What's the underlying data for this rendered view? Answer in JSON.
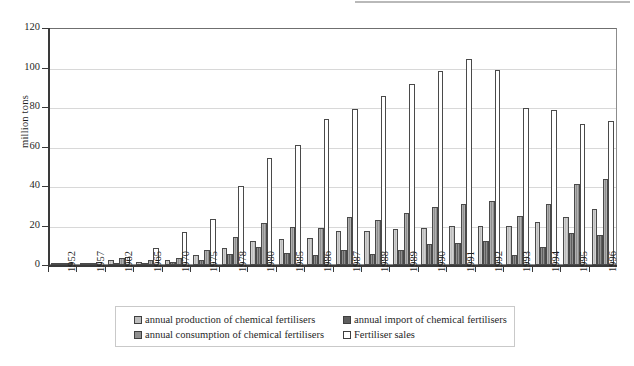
{
  "chart_data": {
    "type": "bar",
    "title": "",
    "xlabel": "",
    "ylabel": "million tons",
    "ylim": [
      0,
      120
    ],
    "ytick_step": 20,
    "yticks": [
      0,
      20,
      40,
      60,
      80,
      100,
      120
    ],
    "grid": true,
    "legend_position": "bottom",
    "categories": [
      "1952",
      "1957",
      "1962",
      "1965",
      "1970",
      "1975",
      "1978",
      "1980",
      "1985",
      "1986",
      "1987",
      "1988",
      "1989",
      "1990",
      "1991",
      "1992",
      "1993",
      "1994",
      "1995",
      "1996"
    ],
    "series": [
      {
        "name": "annual production of chemical fertilisers",
        "color": "#bdbdbd",
        "values": [
          0.1,
          0.8,
          2.3,
          1.7,
          2.4,
          5.2,
          8.7,
          12.2,
          13.4,
          13.7,
          17.0,
          17.3,
          18.3,
          18.8,
          19.8,
          20.0,
          19.9,
          22.0,
          24.5,
          28.3
        ]
      },
      {
        "name": "annual import of  chemical fertilisers",
        "color": "#5e5e5e",
        "values": [
          0.1,
          0.3,
          1.0,
          0.9,
          1.3,
          2.5,
          5.4,
          8.9,
          6.1,
          5.2,
          7.5,
          5.5,
          7.8,
          10.5,
          11.0,
          12.4,
          5.0,
          9.0,
          16.3,
          15.0
        ]
      },
      {
        "name": "annual consumption of  chemical fertilisers",
        "color": "#8f8f8f",
        "values": [
          0.2,
          1.1,
          3.3,
          2.6,
          3.7,
          7.7,
          14.1,
          21.1,
          19.5,
          18.9,
          24.5,
          22.8,
          26.1,
          29.3,
          30.8,
          32.4,
          24.9,
          31.0,
          40.8,
          43.3
        ]
      },
      {
        "name": "Fertiliser sales",
        "color": "#ffffff",
        "values": [
          0.3,
          1.5,
          4.2,
          8.8,
          16.6,
          23.4,
          40.0,
          54.2,
          61.0,
          74.0,
          79.0,
          85.8,
          91.8,
          98.0,
          104.5,
          98.5,
          79.6,
          78.6,
          71.3,
          72.7
        ]
      }
    ]
  },
  "axis": {
    "y_title": "million tons"
  },
  "legend": {
    "items": [
      {
        "label": "annual production of chemical fertilisers",
        "swatch": "#bdbdbd",
        "col": "a",
        "row": 1
      },
      {
        "label": "annual import of  chemical fertilisers",
        "swatch": "#5e5e5e",
        "col": "b",
        "row": 1
      },
      {
        "label": "annual consumption of  chemical fertilisers",
        "swatch": "#8f8f8f",
        "col": "a",
        "row": 2
      },
      {
        "label": "Fertiliser sales",
        "swatch": "#ffffff",
        "col": "b",
        "row": 2
      }
    ]
  }
}
